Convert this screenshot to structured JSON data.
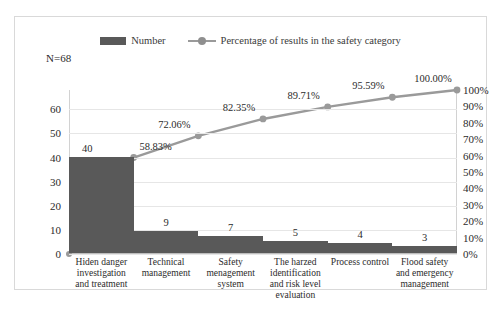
{
  "annotation": {
    "sample_size": "N=68"
  },
  "legend": {
    "items": [
      {
        "label": "Number",
        "marker": "bar-swatch",
        "color": "#595959"
      },
      {
        "label": "Percentage of results in the safety category",
        "marker": "line-marker-swatch",
        "color": "#9a9a9a"
      }
    ]
  },
  "axes": {
    "left_ticks": [
      "0",
      "10",
      "20",
      "30",
      "40",
      "50",
      "60"
    ],
    "right_ticks": [
      "0%",
      "10%",
      "20%",
      "30%",
      "40%",
      "50%",
      "60%",
      "70%",
      "80%",
      "90%",
      "100%"
    ]
  },
  "chart_data": {
    "type": "bar",
    "title": "",
    "subtitle": "",
    "xlabel": "",
    "ylabel": "",
    "ylim": [
      0,
      68
    ],
    "y2lim": [
      0,
      100
    ],
    "grid": true,
    "legend_position": "top-center",
    "categories": [
      "Hiden danger investigation and treatment",
      "Technical management",
      "Safety menagement system",
      "The harzed identification and risk level evaluation",
      "Process control",
      "Flood safety and emergency management"
    ],
    "series": [
      {
        "name": "Number",
        "type": "bar",
        "values": [
          40,
          9,
          7,
          5,
          4,
          3
        ],
        "value_labels": [
          "40",
          "9",
          "7",
          "5",
          "4",
          "3"
        ],
        "color": "#595959",
        "axis": "left"
      },
      {
        "name": "Percentage of results in the safety category",
        "type": "line",
        "values": [
          58.83,
          72.06,
          82.35,
          89.71,
          95.59,
          100.0
        ],
        "value_labels": [
          "58.83%",
          "72.06%",
          "82.35%",
          "89.71%",
          "95.59%",
          "100.00%"
        ],
        "color": "#9a9a9a",
        "axis": "right"
      }
    ],
    "origin_point": {
      "x": 0,
      "y": 0,
      "note": "line starts at axis origin"
    }
  }
}
